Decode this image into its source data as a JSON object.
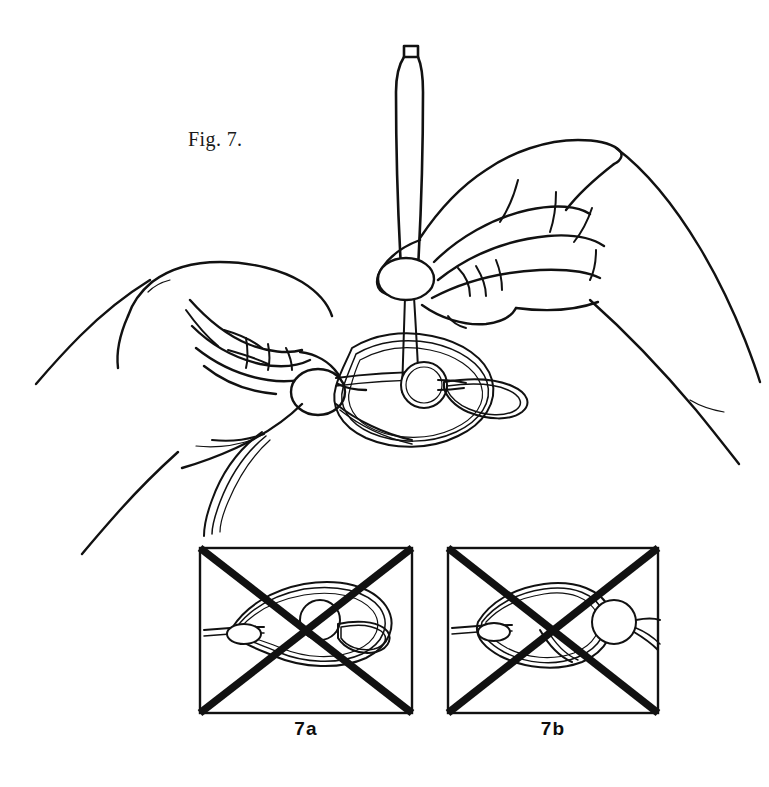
{
  "figure": {
    "caption": "Fig. 7.",
    "caption_x": 188,
    "caption_y": 128,
    "style": "black-and-white line art",
    "background_color": "#ffffff",
    "ink_color": "#111111"
  },
  "scene": {
    "tool": {
      "name": "fid-needle",
      "description": "slender tapered fid with rounded cap, held vertically",
      "cap_label": "",
      "tip_passes_through": "knot-center-loop"
    },
    "left_hand": {
      "name": "left-hand",
      "description": "left hand, fingers curled, thumb pinching the cord",
      "thumbnail": "oval thumbnail"
    },
    "right_hand": {
      "name": "right-hand",
      "description": "right hand gripping the fid, thumb forward",
      "thumbnail": "oval thumbnail"
    },
    "cord": {
      "name": "cord",
      "description": "multi-strand cord forming an open overhand loop with a drawn bight",
      "loose_ends": "two loose strands hanging at lower left",
      "bight": "tear-drop bight pulled to the right"
    }
  },
  "panels": [
    {
      "id": "7a",
      "label": "7a",
      "label_x": 306,
      "label_y": 730,
      "x": 200,
      "y": 548,
      "width": 212,
      "height": 165,
      "crossed_out": true,
      "description": "detail of the loose knot before tightening, bight still open"
    },
    {
      "id": "7b",
      "label": "7b",
      "label_x": 553,
      "label_y": 730,
      "x": 448,
      "y": 548,
      "width": 210,
      "height": 165,
      "crossed_out": true,
      "description": "detail of the knot drawn up tight with the bead-like loop at right"
    }
  ],
  "colors": {
    "ink": "#111111",
    "paper": "#ffffff",
    "cross": "#111111"
  }
}
